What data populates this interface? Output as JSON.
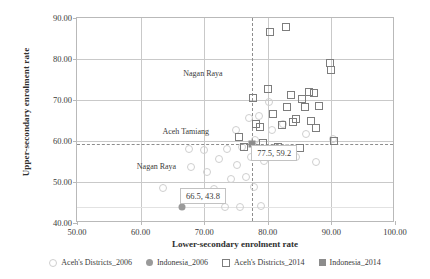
{
  "chart_data": {
    "type": "scatter",
    "title": "",
    "xlabel": "Lower-secondary enrolment rate",
    "ylabel": "Upper-secondary enrolment rate",
    "xlim": [
      50.0,
      100.0
    ],
    "ylim": [
      40.0,
      90.0
    ],
    "xticks": [
      "50.00",
      "60.00",
      "70.00",
      "80.00",
      "90.00",
      "100.00"
    ],
    "yticks": [
      "90.00",
      "80.00",
      "70.00",
      "60.00",
      "50.00",
      "40.00"
    ],
    "xtick_values": [
      50,
      60,
      70,
      80,
      90,
      100
    ],
    "ytick_values": [
      90,
      80,
      70,
      60,
      50,
      40
    ],
    "grid": true,
    "legend_position": "bottom",
    "series": [
      {
        "name": "Aceh's Districts_2006",
        "marker": "circle-open",
        "color": "#cfcfcf",
        "points": [
          [
            63.6,
            48.6
          ],
          [
            67.6,
            58.0
          ],
          [
            68.0,
            53.7
          ],
          [
            70.0,
            57.8
          ],
          [
            70.4,
            52.5
          ],
          [
            71.6,
            48.3
          ],
          [
            72.4,
            55.5
          ],
          [
            73.2,
            44.0
          ],
          [
            73.6,
            58.1
          ],
          [
            74.2,
            50.7
          ],
          [
            75.0,
            62.6
          ],
          [
            75.2,
            54.2
          ],
          [
            75.6,
            43.9
          ],
          [
            76.0,
            58.6
          ],
          [
            76.6,
            51.3
          ],
          [
            77.0,
            65.6
          ],
          [
            77.4,
            56.0
          ],
          [
            77.8,
            48.8
          ],
          [
            78.0,
            60.3
          ],
          [
            78.6,
            66.0
          ],
          [
            79.0,
            44.1
          ],
          [
            79.4,
            55.2
          ],
          [
            80.2,
            69.4
          ],
          [
            80.6,
            62.6
          ],
          [
            81.0,
            57.0
          ],
          [
            82.4,
            64.2
          ],
          [
            83.0,
            58.3
          ],
          [
            84.4,
            56.0
          ],
          [
            86.0,
            61.6
          ],
          [
            87.6,
            55.0
          ],
          [
            90.2,
            60.4
          ]
        ]
      },
      {
        "name": "Indonesia_2006",
        "marker": "circle-fill",
        "color": "#9a9a9a",
        "points": [
          [
            66.5,
            43.8
          ]
        ],
        "data_label": "66.5,  43.8"
      },
      {
        "name": "Aceh's Districts_2014",
        "marker": "square-open",
        "color": "#7d7d7d",
        "points": [
          [
            75.4,
            60.9
          ],
          [
            76.3,
            58.5
          ],
          [
            77.6,
            70.6
          ],
          [
            78.2,
            64.2
          ],
          [
            78.8,
            63.4
          ],
          [
            79.2,
            59.5
          ],
          [
            80.0,
            72.8
          ],
          [
            80.3,
            86.5
          ],
          [
            80.8,
            66.6
          ],
          [
            81.6,
            58.5
          ],
          [
            82.2,
            63.8
          ],
          [
            82.8,
            87.8
          ],
          [
            83.0,
            68.2
          ],
          [
            83.6,
            71.3
          ],
          [
            84.0,
            64.6
          ],
          [
            84.4,
            65.3
          ],
          [
            85.0,
            58.3
          ],
          [
            85.4,
            70.2
          ],
          [
            85.8,
            68.2
          ],
          [
            86.4,
            72.0
          ],
          [
            86.8,
            65.0
          ],
          [
            87.2,
            71.8
          ],
          [
            87.6,
            63.2
          ],
          [
            88.0,
            68.6
          ],
          [
            89.8,
            79.0
          ],
          [
            90.0,
            77.2
          ],
          [
            90.4,
            60.0
          ]
        ]
      },
      {
        "name": "Indonesia_2014",
        "marker": "square-fill",
        "color": "#8c8c8c",
        "points": [
          [
            77.5,
            59.2
          ]
        ],
        "data_label": "77.5,  59.2"
      }
    ],
    "reference_lines": [
      {
        "axis": "vertical",
        "value": 77.5,
        "style": "dashed"
      },
      {
        "axis": "horizontal",
        "value": 59.2,
        "style": "dashed"
      },
      {
        "axis": "horizontal",
        "value": 43.8,
        "style": "faint"
      }
    ],
    "annotations": [
      {
        "text": "Nagan Raya",
        "x": 69.8,
        "y": 76.6
      },
      {
        "text": "Aceh Tamiang",
        "x": 67.1,
        "y": 62.5
      },
      {
        "text": "Nagan Raya",
        "x": 62.5,
        "y": 53.8
      },
      {
        "text": "77.5,  59.2",
        "x": 81.0,
        "y": 57.0,
        "boxed": true
      },
      {
        "text": "66.5,  43.8",
        "x": 69.8,
        "y": 46.6,
        "boxed": true
      }
    ]
  },
  "legend": {
    "items": [
      {
        "label": "Aceh's Districts_2006",
        "marker": "circle-open-icon"
      },
      {
        "label": "Indonesia_2006",
        "marker": "circle-fill-icon"
      },
      {
        "label": "Aceh's Districts_2014",
        "marker": "square-open-icon"
      },
      {
        "label": "Indonesia_2014",
        "marker": "square-fill-icon"
      }
    ]
  }
}
